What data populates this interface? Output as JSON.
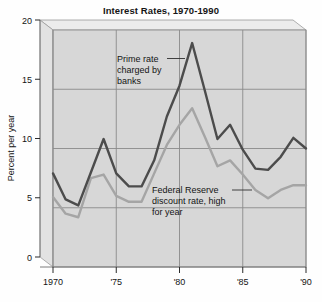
{
  "chart_data": {
    "type": "line",
    "title": "Interest Rates, 1970-1990",
    "xlabel": "",
    "ylabel": "Percent per year",
    "xlim": [
      1970,
      1990
    ],
    "ylim": [
      0,
      20
    ],
    "grid": true,
    "legend_position": "annotations-inline",
    "x": [
      1970,
      1971,
      1972,
      1973,
      1974,
      1975,
      1976,
      1977,
      1978,
      1979,
      1980,
      1981,
      1982,
      1983,
      1984,
      1985,
      1986,
      1987,
      1988,
      1989,
      1990
    ],
    "xtick_labels": [
      "1970",
      "'75",
      "'80",
      "'85",
      "'90"
    ],
    "xtick_values": [
      1970,
      1975,
      1980,
      1985,
      1990
    ],
    "ytick_labels": [
      "0",
      "5",
      "10",
      "15",
      "20"
    ],
    "ytick_values": [
      0,
      5,
      10,
      15,
      20
    ],
    "series": [
      {
        "name": "Prime rate charged by banks",
        "color": "#4c4c4c",
        "values": [
          7.9,
          5.7,
          5.2,
          8.0,
          10.8,
          7.9,
          6.8,
          6.8,
          9.0,
          12.7,
          15.3,
          18.9,
          14.9,
          10.8,
          12.0,
          9.9,
          8.3,
          8.2,
          9.3,
          10.9,
          10.0
        ]
      },
      {
        "name": "Federal Reserve discount rate, high for year",
        "color": "#a5a5a5",
        "values": [
          5.9,
          4.5,
          4.2,
          7.5,
          7.8,
          6.0,
          5.5,
          5.5,
          7.9,
          10.3,
          12.0,
          13.4,
          11.0,
          8.5,
          9.0,
          7.8,
          6.5,
          5.8,
          6.5,
          6.9,
          6.9
        ]
      }
    ],
    "annotations": [
      {
        "id": "prime-rate-annotation",
        "lines": [
          "Prime rate",
          "charged by",
          "banks"
        ]
      },
      {
        "id": "fed-discount-annotation",
        "lines": [
          "Federal Reserve",
          "discount rate, high",
          "for year"
        ]
      }
    ]
  }
}
